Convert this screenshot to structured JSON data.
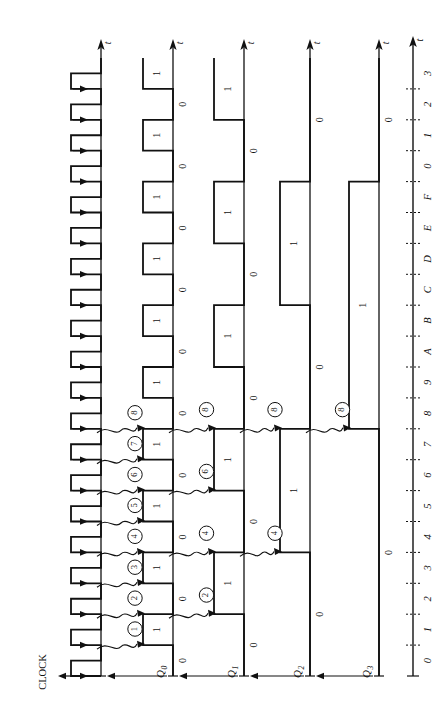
{
  "figure": {
    "title": "",
    "orientation": "rotated-90-ccw",
    "clock_label": "CLOCK",
    "time_axis_label": "t"
  },
  "signals": [
    {
      "name": "CLOCK",
      "label": "CLOCK",
      "type": "clock",
      "values": []
    },
    {
      "name": "Q0",
      "label": "Q",
      "sub": "0",
      "values": [
        "0",
        "1",
        "0",
        "1",
        "0",
        "1",
        "0",
        "1",
        "0",
        "1",
        "0",
        "1",
        "0",
        "1",
        "0",
        "1",
        "0",
        "1",
        "0",
        "1"
      ]
    },
    {
      "name": "Q1",
      "label": "Q",
      "sub": "1",
      "values": [
        "0",
        "0",
        "1",
        "1",
        "0",
        "0",
        "1",
        "1",
        "0",
        "0",
        "1",
        "1",
        "0",
        "0",
        "1",
        "1",
        "0",
        "0",
        "1",
        "1"
      ]
    },
    {
      "name": "Q2",
      "label": "Q",
      "sub": "2",
      "values": [
        "0",
        "0",
        "0",
        "0",
        "1",
        "1",
        "1",
        "1",
        "0",
        "0",
        "0",
        "0",
        "1",
        "1",
        "1",
        "1",
        "0",
        "0",
        "0",
        "0"
      ]
    },
    {
      "name": "Q3",
      "label": "Q",
      "sub": "3",
      "values": [
        "0",
        "0",
        "0",
        "0",
        "0",
        "0",
        "0",
        "0",
        "1",
        "1",
        "1",
        "1",
        "1",
        "1",
        "1",
        "1",
        "0",
        "0",
        "0",
        "0"
      ]
    }
  ],
  "time_ticks": [
    "0",
    "1",
    "2",
    "3",
    "4",
    "5",
    "6",
    "7",
    "8",
    "9",
    "A",
    "B",
    "C",
    "D",
    "E",
    "F",
    "0",
    "1",
    "2",
    "3"
  ],
  "callouts": {
    "clock_to_q0": [
      "1",
      "2",
      "3",
      "4",
      "5",
      "6",
      "7",
      "8"
    ],
    "q0_to_q1": [
      "2",
      "4",
      "6",
      "8"
    ],
    "q1_to_q2": [
      "4",
      "8"
    ],
    "q2_to_q3": [
      "8"
    ]
  },
  "chart_data": {
    "type": "line",
    "xlabel": "t",
    "ylabel": "",
    "categories": [
      "0",
      "1",
      "2",
      "3",
      "4",
      "5",
      "6",
      "7",
      "8",
      "9",
      "A",
      "B",
      "C",
      "D",
      "E",
      "F",
      "0",
      "1",
      "2",
      "3"
    ],
    "series": [
      {
        "name": "CLOCK",
        "values": [
          1,
          0,
          1,
          0,
          1,
          0,
          1,
          0,
          1,
          0,
          1,
          0,
          1,
          0,
          1,
          0,
          1,
          0,
          1,
          0
        ]
      },
      {
        "name": "Q0",
        "values": [
          0,
          1,
          0,
          1,
          0,
          1,
          0,
          1,
          0,
          1,
          0,
          1,
          0,
          1,
          0,
          1,
          0,
          1,
          0,
          1
        ]
      },
      {
        "name": "Q1",
        "values": [
          0,
          0,
          1,
          1,
          0,
          0,
          1,
          1,
          0,
          0,
          1,
          1,
          0,
          0,
          1,
          1,
          0,
          0,
          1,
          1
        ]
      },
      {
        "name": "Q2",
        "values": [
          0,
          0,
          0,
          0,
          1,
          1,
          1,
          1,
          0,
          0,
          0,
          0,
          1,
          1,
          1,
          1,
          0,
          0,
          0,
          0
        ]
      },
      {
        "name": "Q3",
        "values": [
          0,
          0,
          0,
          0,
          0,
          0,
          0,
          0,
          1,
          1,
          1,
          1,
          1,
          1,
          1,
          1,
          0,
          0,
          0,
          0
        ]
      }
    ],
    "legend": "none",
    "grid": false,
    "xlim": [
      0,
      20
    ],
    "ylim": [
      0,
      1
    ]
  },
  "colors": {
    "line": "#111111",
    "text": "#111111",
    "background": "#ffffff"
  }
}
